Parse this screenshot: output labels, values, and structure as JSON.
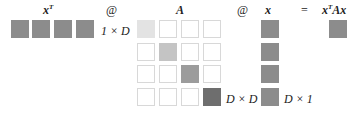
{
  "labels": {
    "xT": "x",
    "xT_sup": "T",
    "at1": "@",
    "A": "A",
    "at2": "@",
    "x": "x",
    "eq": "=",
    "result": "x",
    "result_sup": "T",
    "result_tail": "Ax",
    "dim_xT": "1 × D",
    "dim_A": "D × D",
    "dim_x": "D × 1"
  },
  "colors": {
    "vector": "#8c8c8c",
    "diag": [
      "#e3e3e3",
      "#c4c4c4",
      "#9c9c9c",
      "#6e6e6e"
    ],
    "empty_border": "#d8d8d8"
  },
  "matrix_A": {
    "rows": 4,
    "cols": 4,
    "diagonal_filled": true
  }
}
